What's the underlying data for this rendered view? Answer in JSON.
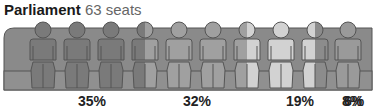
{
  "header": {
    "title": "Parliament",
    "subtitle": "63 seats"
  },
  "chart_data": {
    "type": "pictogram",
    "title": "Parliament 63 seats",
    "total_seats": 63,
    "figures_count": 10,
    "series": [
      {
        "name": "Party 1",
        "value": 35,
        "label": "35%",
        "color": "#7a7a7a"
      },
      {
        "name": "Party 2",
        "value": 32,
        "label": "32%",
        "color": "#a0a0a0"
      },
      {
        "name": "Party 3",
        "value": 19,
        "label": "19%",
        "color": "#d2d2d2"
      },
      {
        "name": "Party 4",
        "value": 8,
        "label": "8%",
        "color": "#8c8c8c"
      },
      {
        "name": "Party 5",
        "value": 6,
        "label": "6%",
        "color": "#9a9a9a"
      }
    ],
    "label_positions_x": [
      92,
      197,
      300,
      352,
      378
    ]
  },
  "colors": {
    "bench": "#8a8a8a",
    "outline": "#555555",
    "text": "#222222",
    "subtext": "#666666"
  }
}
